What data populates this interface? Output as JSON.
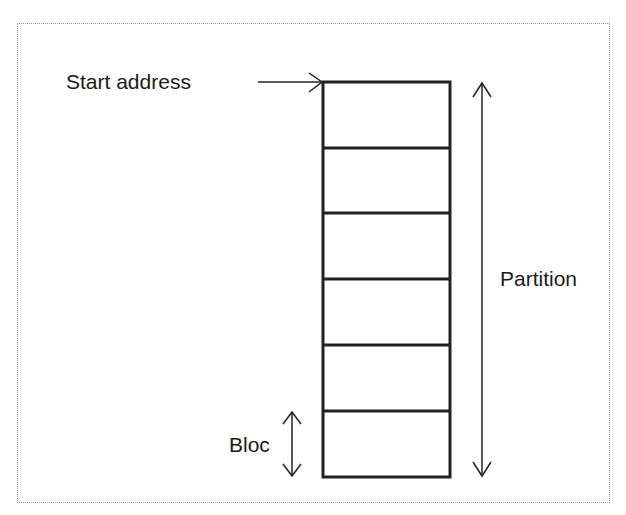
{
  "diagram": {
    "labels": {
      "start_address": "Start address",
      "partition": "Partition",
      "bloc": "Bloc"
    },
    "block_count": 6,
    "colors": {
      "stroke": "#222222",
      "text": "#1a1a1a",
      "frame": "#9a9a9a"
    }
  }
}
